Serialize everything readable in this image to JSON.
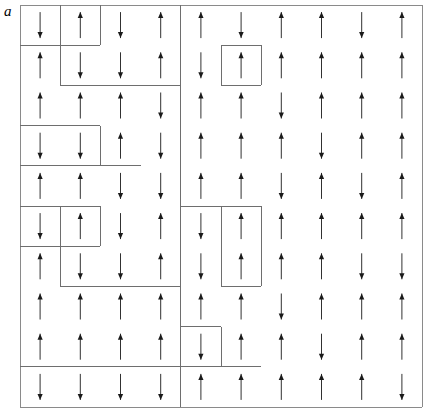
{
  "figure": {
    "panel_label": "a",
    "type": "spin-lattice-diagram",
    "colors": {
      "arrow": "#1a1a1a",
      "boundary": "#6e6e6e",
      "frame": "#8a8a8a",
      "background": "#ffffff"
    },
    "geometry": {
      "origin_x": 20,
      "origin_y": 5,
      "cell_size": 40.2,
      "rows": 10,
      "cols": 10
    },
    "arrow_glyphs": {
      "up": "↑",
      "down": "↓"
    },
    "spins": [
      [
        "down",
        "up",
        "down",
        "up",
        "up",
        "down",
        "up",
        "up",
        "down",
        "up"
      ],
      [
        "up",
        "down",
        "down",
        "up",
        "down",
        "up",
        "up",
        "up",
        "up",
        "up"
      ],
      [
        "up",
        "up",
        "up",
        "down",
        "up",
        "up",
        "down",
        "up",
        "up",
        "up"
      ],
      [
        "down",
        "down",
        "up",
        "down",
        "up",
        "up",
        "up",
        "down",
        "up",
        "up"
      ],
      [
        "up",
        "up",
        "down",
        "down",
        "up",
        "up",
        "down",
        "up",
        "down",
        "up"
      ],
      [
        "down",
        "up",
        "down",
        "up",
        "down",
        "up",
        "up",
        "up",
        "up",
        "up"
      ],
      [
        "up",
        "down",
        "down",
        "up",
        "down",
        "up",
        "up",
        "up",
        "down",
        "down"
      ],
      [
        "up",
        "up",
        "up",
        "up",
        "up",
        "up",
        "down",
        "up",
        "up",
        "up"
      ],
      [
        "up",
        "up",
        "up",
        "up",
        "down",
        "up",
        "up",
        "down",
        "up",
        "up"
      ],
      [
        "down",
        "down",
        "down",
        "down",
        "up",
        "up",
        "up",
        "up",
        "up",
        "down"
      ]
    ],
    "boundary_segments": [
      {
        "name": "frame-top",
        "x1": 0,
        "y1": 0,
        "x2": 10,
        "y2": 0
      },
      {
        "name": "frame-left",
        "x1": 0,
        "y1": 0,
        "x2": 0,
        "y2": 10
      },
      {
        "name": "frame-right",
        "x1": 10,
        "y1": 0,
        "x2": 10,
        "y2": 10
      },
      {
        "name": "frame-bottom",
        "x1": 0,
        "y1": 10,
        "x2": 10,
        "y2": 10
      },
      {
        "name": "cluster-r1-v1",
        "x1": 1,
        "y1": 0,
        "x2": 1,
        "y2": 1
      },
      {
        "name": "cluster-r1-v2",
        "x1": 2,
        "y1": 0,
        "x2": 2,
        "y2": 1
      },
      {
        "name": "cluster-r1-h-left",
        "x1": 0,
        "y1": 1,
        "x2": 2,
        "y2": 1
      },
      {
        "name": "cluster-r2-v-left",
        "x1": 1,
        "y1": 1,
        "x2": 1,
        "y2": 2
      },
      {
        "name": "cluster-r2-h-bottom",
        "x1": 1,
        "y1": 2,
        "x2": 4,
        "y2": 2
      },
      {
        "name": "col4-long-vertical",
        "x1": 4,
        "y1": 0,
        "x2": 4,
        "y2": 10
      },
      {
        "name": "cluster-r2c5-top",
        "x1": 5,
        "y1": 1,
        "x2": 6,
        "y2": 1
      },
      {
        "name": "cluster-r2c5-left",
        "x1": 5,
        "y1": 1,
        "x2": 5,
        "y2": 2
      },
      {
        "name": "cluster-r2c5-right",
        "x1": 6,
        "y1": 1,
        "x2": 6,
        "y2": 2
      },
      {
        "name": "cluster-r2c5-bottom",
        "x1": 5,
        "y1": 2,
        "x2": 6,
        "y2": 2
      },
      {
        "name": "cluster-r4-top",
        "x1": 0,
        "y1": 3,
        "x2": 2,
        "y2": 3
      },
      {
        "name": "cluster-r4-right",
        "x1": 2,
        "y1": 3,
        "x2": 2,
        "y2": 4
      },
      {
        "name": "cluster-r4-bottom",
        "x1": 0,
        "y1": 4,
        "x2": 3,
        "y2": 4
      },
      {
        "name": "cluster-r6-top-left",
        "x1": 0,
        "y1": 5,
        "x2": 1,
        "y2": 5
      },
      {
        "name": "cluster-r6-right-left",
        "x1": 1,
        "y1": 5,
        "x2": 1,
        "y2": 7
      },
      {
        "name": "cluster-r6-bottom-left",
        "x1": 0,
        "y1": 6,
        "x2": 1,
        "y2": 6
      },
      {
        "name": "cluster-r6-span-top",
        "x1": 1,
        "y1": 5,
        "x2": 2,
        "y2": 5
      },
      {
        "name": "cluster-r6-span-right",
        "x1": 2,
        "y1": 5,
        "x2": 2,
        "y2": 6
      },
      {
        "name": "cluster-r6-span-bottom",
        "x1": 1,
        "y1": 6,
        "x2": 2,
        "y2": 6
      },
      {
        "name": "cluster-r7-bottom",
        "x1": 1,
        "y1": 7,
        "x2": 4,
        "y2": 7
      },
      {
        "name": "cluster-r6c5-top",
        "x1": 4,
        "y1": 5,
        "x2": 6,
        "y2": 5
      },
      {
        "name": "cluster-r6c5-left",
        "x1": 5,
        "y1": 5,
        "x2": 5,
        "y2": 7
      },
      {
        "name": "cluster-r6c5-right",
        "x1": 6,
        "y1": 5,
        "x2": 6,
        "y2": 7
      },
      {
        "name": "cluster-r6c5-bottom",
        "x1": 5,
        "y1": 7,
        "x2": 6,
        "y2": 7
      },
      {
        "name": "cluster-r9c5-top",
        "x1": 4,
        "y1": 8,
        "x2": 5,
        "y2": 8
      },
      {
        "name": "cluster-r9c5-left",
        "x1": 4,
        "y1": 8,
        "x2": 4,
        "y2": 9
      },
      {
        "name": "cluster-r9c5-right",
        "x1": 5,
        "y1": 8,
        "x2": 5,
        "y2": 9
      },
      {
        "name": "cluster-r9c5-bottom",
        "x1": 4,
        "y1": 9,
        "x2": 5,
        "y2": 9
      },
      {
        "name": "row10-top",
        "x1": 0,
        "y1": 9,
        "x2": 6,
        "y2": 9
      }
    ]
  }
}
